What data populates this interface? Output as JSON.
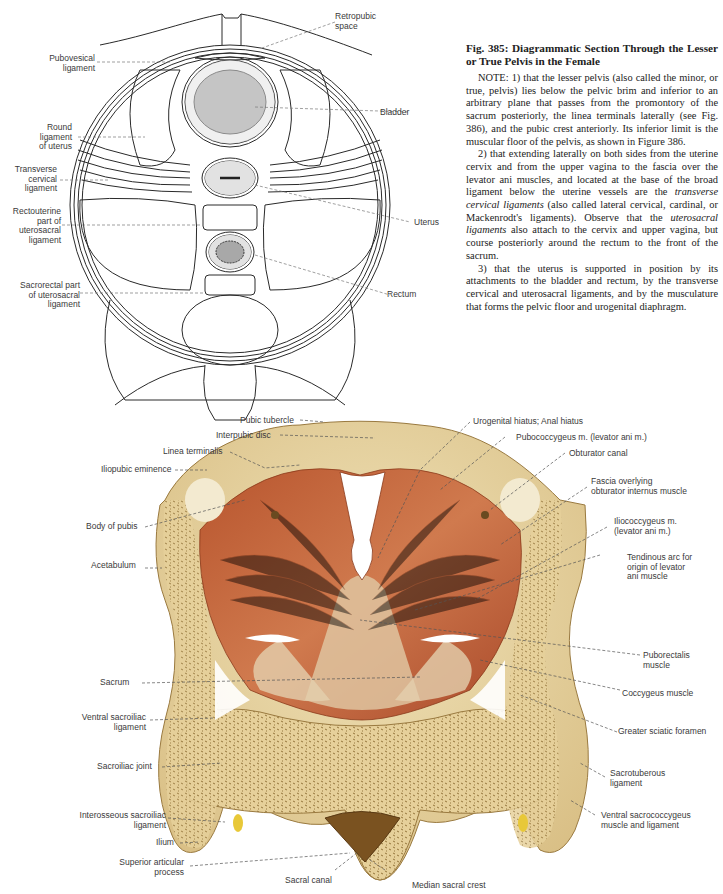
{
  "figure": {
    "number": "Fig. 385",
    "title": "Fig. 385: Diagrammatic Section Through the Lesser or True Pelvis in the Female",
    "note_paragraphs": [
      {
        "pre": "NOTE: 1) that the lesser pelvis (also called the minor, or true, pelvis) lies below the pelvic brim and inferior to an arbitrary plane that passes from the promontory of the sacrum posteriorly, the linea terminals laterally (see Fig. 386), and the pubic crest anteriorly. Its inferior limit is the muscular floor of the pelvis, as shown in Figure 386."
      },
      {
        "pre": "2) that extending laterally on both sides from the uterine cervix and from the upper vagina to the fascia over the levator ani muscles, and located at the base of the broad ligament below the uterine vessels are the ",
        "em1": "transverse cervical ligaments",
        "mid": " (also called lateral cervical, cardinal, or Mackenrodt's ligaments). Observe that the ",
        "em2": "uterosacral ligaments",
        "post": " also attach to the cervix and upper vagina, but course posteriorly around the rectum to the front of the sacrum."
      },
      {
        "pre": "3) that the uterus is supported in position by its attachments to the bladder and rectum, by the transverse cervical and uterosacral ligaments, and by the musculature that forms the pelvic floor and urogenital diaphragm."
      }
    ]
  },
  "diagram_labels": {
    "retropubic_space": "Retropubic\nspace",
    "pubovesical_ligament": "Pubovesical\nligament",
    "bladder": "Bladder",
    "round_ligament": "Round\nligament\nof uterus",
    "transverse_cervical_ligament": "Transverse\ncervical\nligament",
    "rectouterine_part": "Rectouterine\npart of\nuterosacral\nligament",
    "uterus": "Uterus",
    "rectum": "Rectum",
    "sacrorectal_part": "Sacrorectal part\nof uterosacral\nligament"
  },
  "illustration_labels": {
    "pubic_tubercle": "Pubic tubercle",
    "interpubic_disc": "Interpubic disc",
    "linea_terminalis": "Linea terminalis",
    "iliopubic_eminence": "Iliopubic eminence",
    "body_of_pubis": "Body of pubis",
    "acetabulum": "Acetabulum",
    "sacrum": "Sacrum",
    "ventral_sacroiliac_ligament": "Ventral sacroiliac\nligament",
    "sacroiliac_joint": "Sacroiliac joint",
    "interosseous_sacroiliac_ligament": "Interosseous sacroiliac\nligament",
    "ilium": "Ilium",
    "superior_articular_process": "Superior articular\nprocess",
    "sacral_canal": "Sacral canal",
    "median_sacral_crest": "Median sacral crest",
    "urogenital_hiatus": "Urogenital hiatus; Anal hiatus",
    "pubococcygeus": "Pubococcygeus m. (levator ani m.)",
    "obturator_canal": "Obturator canal",
    "fascia_obturator": "Fascia overlying\nobturator internus muscle",
    "iliococcygeus": "Iliococcygeus m.\n(levator ani m.)",
    "tendinous_arc": "Tendinous arc for\norigin of levator\nani muscle",
    "puborectalis": "Puborectalis\nmuscle",
    "coccygeus": "Coccygeus muscle",
    "greater_sciatic_foramen": "Greater sciatic foramen",
    "sacrotuberous_ligament": "Sacrotuberous\nligament",
    "ventral_sacrococcygeus": "Ventral sacrococcygeus\nmuscle and ligament"
  },
  "colors": {
    "bone": "#e8d4a0",
    "bone_dark": "#c9a96a",
    "muscle": "#c8633a",
    "muscle_light": "#e0a07a",
    "organ_gray": "#a8a8a8",
    "organ_light": "#e2e2e2"
  }
}
